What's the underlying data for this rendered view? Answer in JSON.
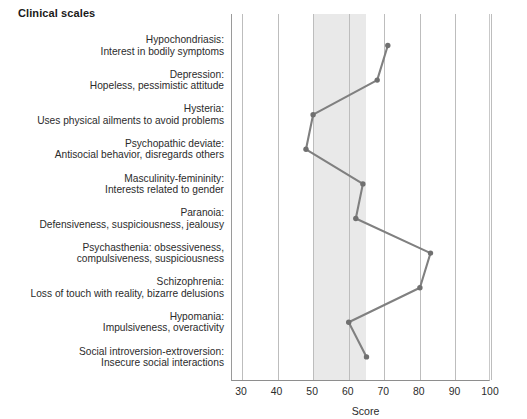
{
  "title": "Clinical scales",
  "axis_title": "Score",
  "colors": {
    "line": "#808080",
    "marker": "#707070",
    "band": "#e9e9e9",
    "grid": "#bdbdbd",
    "frame": "#8e8e8e",
    "text": "#2b2b2b"
  },
  "chart_data": {
    "type": "line",
    "orientation": "horizontal",
    "title": "Clinical scales",
    "xlabel": "Score",
    "ylabel": "",
    "xlim": [
      28,
      102
    ],
    "xticks": [
      30,
      40,
      50,
      60,
      70,
      80,
      90,
      100
    ],
    "grid": true,
    "legend": null,
    "normal_band": [
      50,
      65
    ],
    "categories": [
      "Hypochondriasis: Interest in bodily symptoms",
      "Depression: Hopeless, pessimistic attitude",
      "Hysteria: Uses physical ailments to avoid problems",
      "Psychopathic deviate: Antisocial behavior, disregards others",
      "Masculinity-femininity: Interests related to gender",
      "Paranoia: Defensiveness, suspiciousness, jealousy",
      "Psychasthenia: obsessiveness, compulsiveness, suspiciousness",
      "Schizophrenia: Loss of touch with reality, bizarre delusions",
      "Hypomania: Impulsiveness, overactivity",
      "Social introversion-extroversion: Insecure social interactions"
    ],
    "values": [
      71,
      68,
      50,
      48,
      64,
      62,
      83,
      80,
      60,
      65
    ]
  },
  "scales": [
    {
      "line1": "Hypochondriasis:",
      "line2": "Interest in bodily symptoms"
    },
    {
      "line1": "Depression:",
      "line2": "Hopeless, pessimistic attitude"
    },
    {
      "line1": "Hysteria:",
      "line2": "Uses physical ailments to avoid problems"
    },
    {
      "line1": "Psychopathic deviate:",
      "line2": "Antisocial behavior, disregards others"
    },
    {
      "line1": "Masculinity-femininity:",
      "line2": "Interests related to gender"
    },
    {
      "line1": "Paranoia:",
      "line2": "Defensiveness, suspiciousness, jealousy"
    },
    {
      "line1": "Psychasthenia: obsessiveness,",
      "line2": "compulsiveness, suspiciousness"
    },
    {
      "line1": "Schizophrenia:",
      "line2": "Loss of touch with reality, bizarre delusions"
    },
    {
      "line1": "Hypomania:",
      "line2": "Impulsiveness, overactivity"
    },
    {
      "line1": "Social introversion-extroversion:",
      "line2": "Insecure social interactions"
    }
  ],
  "xticks": [
    {
      "label": "30"
    },
    {
      "label": "40"
    },
    {
      "label": "50"
    },
    {
      "label": "60"
    },
    {
      "label": "70"
    },
    {
      "label": "80"
    },
    {
      "label": "90"
    },
    {
      "label": "100"
    }
  ]
}
